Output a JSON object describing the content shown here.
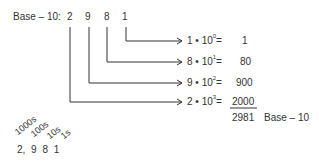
{
  "header": {
    "label": "Base – 10:"
  },
  "digits": [
    "2",
    "9",
    "8",
    "1"
  ],
  "rows": [
    {
      "digit": "1",
      "base": "10",
      "exp": "0",
      "op": "•",
      "value": "1"
    },
    {
      "digit": "8",
      "base": "10",
      "exp": "1",
      "op": "•",
      "value": "80"
    },
    {
      "digit": "9",
      "base": "10",
      "exp": "2",
      "op": "•",
      "value": "900"
    },
    {
      "digit": "2",
      "base": "10",
      "exp": "3",
      "op": "•",
      "value": "2000"
    }
  ],
  "total": {
    "value": "2981",
    "label": "Base – 10"
  },
  "place_labels": [
    "1000s",
    "100s",
    "10s",
    "1s"
  ],
  "place_digits": "2, 9 8 1",
  "colors": {
    "line": "#333333",
    "text": "#333333"
  }
}
